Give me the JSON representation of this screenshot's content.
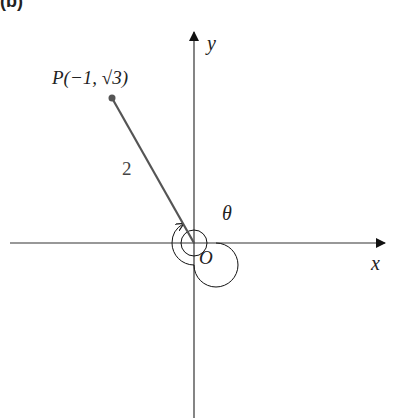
{
  "figure": {
    "panel_label": "(b)",
    "axes": {
      "x_label": "x",
      "y_label": "y",
      "origin_label": "O"
    },
    "point": {
      "label": "P(−1, √3)",
      "coords": [
        -1,
        1.7320508
      ]
    },
    "segment_length_label": "2",
    "angle_label": "θ",
    "colors": {
      "axes": "#222222",
      "segment": "#555555",
      "point": "#555555"
    }
  }
}
